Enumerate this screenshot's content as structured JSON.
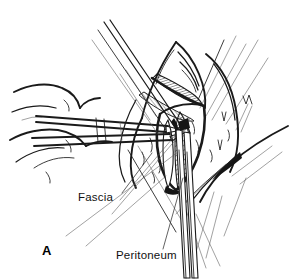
{
  "figure": {
    "panel_letter": "A",
    "style": "black-and-white pen-and-ink line art",
    "background_color": "#ffffff",
    "ink_color": "#1a1a1a"
  },
  "labels": [
    {
      "id": "fascia",
      "text": "Fascia",
      "x": 78,
      "y": 201,
      "leader_from": [
        122,
        193
      ],
      "leader_to": [
        152,
        153
      ],
      "points_to": "fascial layer at wound edge"
    },
    {
      "id": "peritoneum",
      "text": "Peritoneum",
      "x": 116,
      "y": 259,
      "leader_from": [
        163,
        249
      ],
      "leader_to": [
        183,
        178
      ],
      "points_to": "peritoneal layer being incised"
    }
  ],
  "panel": {
    "letter": "A",
    "x": 42,
    "y": 255
  },
  "structures": [
    {
      "name": "hand",
      "note": "surgeon's hand and fingers at left holding the forceps"
    },
    {
      "name": "tissue-forceps",
      "note": "long forceps crossing from left, grasping the tented peritoneum"
    },
    {
      "name": "scissors",
      "note": "scissors entering the incision and extending downward off the panel"
    },
    {
      "name": "wound-edges",
      "note": "retracted layers of abdominal wall with cross-hatched cut surfaces"
    },
    {
      "name": "retractor-lines",
      "note": "fine instrument and retractor shafts radiating from the wound"
    }
  ]
}
